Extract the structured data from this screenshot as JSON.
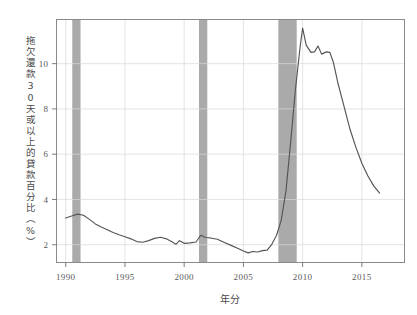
{
  "chart_data": {
    "type": "line",
    "title": "",
    "xlabel": "年分",
    "ylabel": "拖欠還款30天或以上的貸款百分比（%）",
    "xlim": [
      1989.2,
      1992.0
    ],
    "ylim": [
      1.2,
      11.95
    ],
    "xticks": [
      1990,
      1995,
      2000,
      2005,
      2010,
      2015
    ],
    "xticklabels": [
      "1990",
      "1995",
      "2000",
      "2005",
      "2010",
      "2015"
    ],
    "yticks": [
      2,
      4,
      6,
      8,
      10
    ],
    "yticklabels": [
      "2",
      "4",
      "6",
      "8",
      "10"
    ],
    "grid": true,
    "legend": null,
    "line_color": "#555555",
    "band_color": "#aaaaaa",
    "grid_color": "#d8d8d8",
    "frame_color": "#8a8a8a",
    "shaded_regions": [
      {
        "label": "recession-1990",
        "x0": 1990.55,
        "x1": 1991.25
      },
      {
        "label": "recession-2001",
        "x0": 2001.25,
        "x1": 2001.95
      },
      {
        "label": "recession-2008",
        "x0": 2007.95,
        "x1": 2009.5
      }
    ],
    "x": [
      1990.0,
      1990.5,
      1991.0,
      1991.5,
      1992.0,
      1992.5,
      1993.0,
      1993.5,
      1994.0,
      1994.5,
      1995.0,
      1995.5,
      1996.0,
      1996.5,
      1997.0,
      1997.5,
      1998.0,
      1998.5,
      1999.0,
      1999.3,
      1999.6,
      2000.0,
      2000.5,
      2001.0,
      2001.4,
      2001.8,
      2002.2,
      2002.8,
      2003.4,
      2004.0,
      2004.6,
      2005.0,
      2005.4,
      2005.8,
      2006.2,
      2006.6,
      2007.0,
      2007.4,
      2007.8,
      2008.2,
      2008.6,
      2009.0,
      2009.4,
      2009.8,
      2010.0,
      2010.3,
      2010.7,
      2011.0,
      2011.3,
      2011.6,
      2012.0,
      2012.3,
      2012.6,
      2013.0,
      2013.5,
      2014.0,
      2014.5,
      2015.0,
      2015.5,
      2016.0,
      2016.5
    ],
    "y": [
      3.18,
      3.27,
      3.35,
      3.3,
      3.12,
      2.92,
      2.78,
      2.66,
      2.54,
      2.44,
      2.35,
      2.26,
      2.14,
      2.11,
      2.18,
      2.28,
      2.33,
      2.26,
      2.12,
      2.02,
      2.18,
      2.06,
      2.08,
      2.12,
      2.42,
      2.32,
      2.3,
      2.24,
      2.1,
      1.96,
      1.82,
      1.72,
      1.64,
      1.7,
      1.68,
      1.74,
      1.76,
      2.02,
      2.42,
      3.1,
      4.4,
      6.6,
      8.9,
      10.8,
      11.57,
      10.82,
      10.5,
      10.52,
      10.78,
      10.42,
      10.52,
      10.5,
      10.05,
      9.1,
      8.1,
      7.1,
      6.3,
      5.6,
      5.05,
      4.6,
      4.28
    ]
  }
}
